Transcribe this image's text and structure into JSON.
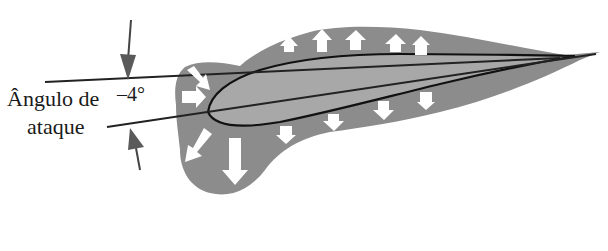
{
  "diagram": {
    "type": "airfoil-pressure-distribution",
    "label_line1": "Ângulo de",
    "label_line2": "ataque",
    "angle_value": "–4°",
    "elements": {
      "airfoil": "airfoil-profile",
      "pressure_region": "pressure-envelope",
      "reference_line": "horizontal-reference-line",
      "chord_line": "chord-line",
      "angle_arrows": [
        "angle-arrow-top",
        "angle-arrow-bottom"
      ],
      "pressure_arrows_upper_count": 5,
      "pressure_arrows_lower_count": 6,
      "pressure_arrows_leading_edge_count": 2
    },
    "colors": {
      "envelope": "#8c8c8c",
      "airfoil_fill": "#a8a8a8",
      "outline": "#111111",
      "arrow_fill": "#ffffff",
      "dimension_arrow": "#5a5a5a"
    }
  }
}
